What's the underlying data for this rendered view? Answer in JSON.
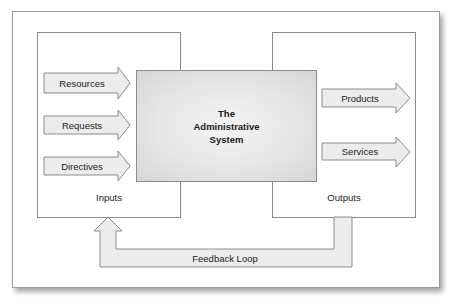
{
  "diagram": {
    "title": "The Administrative System",
    "center": {
      "lines": [
        "The",
        "Administrative",
        "System"
      ]
    },
    "inputs": {
      "label": "Inputs",
      "items": [
        {
          "label": "Resources"
        },
        {
          "label": "Requests"
        },
        {
          "label": "Directives"
        }
      ]
    },
    "outputs": {
      "label": "Outputs",
      "items": [
        {
          "label": "Products"
        },
        {
          "label": "Services"
        }
      ]
    },
    "feedback": {
      "label": "Feedback Loop"
    },
    "colors": {
      "arrow_fill": "#ececec",
      "border": "#8c8c8c",
      "center_fill": "#e6e6e6",
      "text": "#222222"
    }
  }
}
